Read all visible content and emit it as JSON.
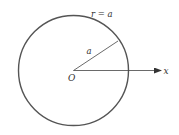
{
  "diagram": {
    "type": "polar-circle",
    "circle_label": "r = a",
    "radius_label": "a",
    "origin_label": "O",
    "axis_label": "x",
    "colors": {
      "stroke": "#555555",
      "text": "#333333",
      "background": "#ffffff"
    },
    "geometry": {
      "center": [
        73.5,
        70.5
      ],
      "radius": 55,
      "radius_endpoint": [
        118,
        41
      ],
      "axis_end": [
        161,
        70.5
      ]
    }
  }
}
